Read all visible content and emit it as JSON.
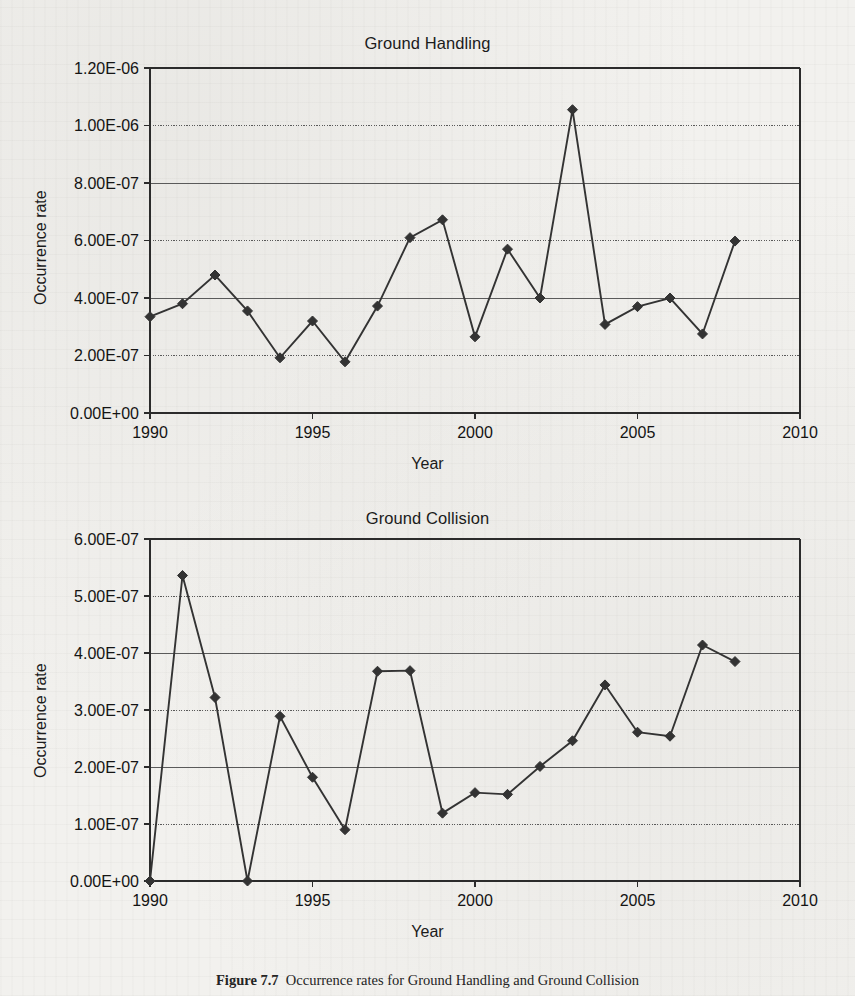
{
  "figure": {
    "caption_label": "Figure 7.7",
    "caption_text": "Occurrence rates for Ground Handling and Ground Collision"
  },
  "charts": [
    {
      "id": "ground-handling",
      "title": "Ground Handling",
      "xlabel": "Year",
      "ylabel": "Occurrence rate",
      "yticks": [
        "0.00E+00",
        "2.00E-07",
        "4.00E-07",
        "6.00E-07",
        "8.00E-07",
        "1.00E-06",
        "1.20E-06"
      ],
      "xticks": [
        "1990",
        "1995",
        "2000",
        "2005",
        "2010"
      ]
    },
    {
      "id": "ground-collision",
      "title": "Ground Collision",
      "xlabel": "Year",
      "ylabel": "Occurrence rate",
      "yticks": [
        "0.00E+00",
        "1.00E-07",
        "2.00E-07",
        "3.00E-07",
        "4.00E-07",
        "5.00E-07",
        "6.00E-07"
      ],
      "xticks": [
        "1990",
        "1995",
        "2000",
        "2005",
        "2010"
      ]
    }
  ],
  "chart_data": [
    {
      "type": "line",
      "id": "ground-handling",
      "title": "Ground Handling",
      "xlabel": "Year",
      "ylabel": "Occurrence rate",
      "xlim": [
        1990,
        2010
      ],
      "ylim": [
        0,
        1.2e-06
      ],
      "xticks": [
        1990,
        1995,
        2000,
        2005,
        2010
      ],
      "yticks": [
        0,
        2e-07,
        4e-07,
        6e-07,
        8e-07,
        1e-06,
        1.2e-06
      ],
      "grid": "horizontal",
      "legend": "none",
      "marker": "diamond",
      "x": [
        1990,
        1991,
        1992,
        1993,
        1994,
        1995,
        1996,
        1997,
        1998,
        1999,
        2000,
        2001,
        2002,
        2003,
        2004,
        2005,
        2006,
        2007,
        2008
      ],
      "values": [
        3.35e-07,
        3.8e-07,
        4.8e-07,
        3.55e-07,
        1.92e-07,
        3.2e-07,
        1.78e-07,
        3.72e-07,
        6.1e-07,
        6.72e-07,
        2.65e-07,
        5.7e-07,
        4e-07,
        1.055e-06,
        3.08e-07,
        3.7e-07,
        4e-07,
        2.75e-07,
        5.98e-07
      ]
    },
    {
      "type": "line",
      "id": "ground-collision",
      "title": "Ground Collision",
      "xlabel": "Year",
      "ylabel": "Occurrence rate",
      "xlim": [
        1990,
        2010
      ],
      "ylim": [
        0,
        6e-07
      ],
      "xticks": [
        1990,
        1995,
        2000,
        2005,
        2010
      ],
      "yticks": [
        0,
        1e-07,
        2e-07,
        3e-07,
        4e-07,
        5e-07,
        6e-07
      ],
      "grid": "horizontal",
      "legend": "none",
      "marker": "diamond",
      "x": [
        1990,
        1991,
        1992,
        1993,
        1994,
        1995,
        1996,
        1997,
        1998,
        1999,
        2000,
        2001,
        2002,
        2003,
        2004,
        2005,
        2006,
        2007,
        2008
      ],
      "values": [
        0,
        5.36e-07,
        3.22e-07,
        0,
        2.89e-07,
        1.82e-07,
        9e-08,
        3.68e-07,
        3.69e-07,
        1.19e-07,
        1.55e-07,
        1.52e-07,
        2.01e-07,
        2.46e-07,
        3.44e-07,
        2.61e-07,
        2.54e-07,
        4.14e-07,
        3.85e-07
      ]
    }
  ]
}
